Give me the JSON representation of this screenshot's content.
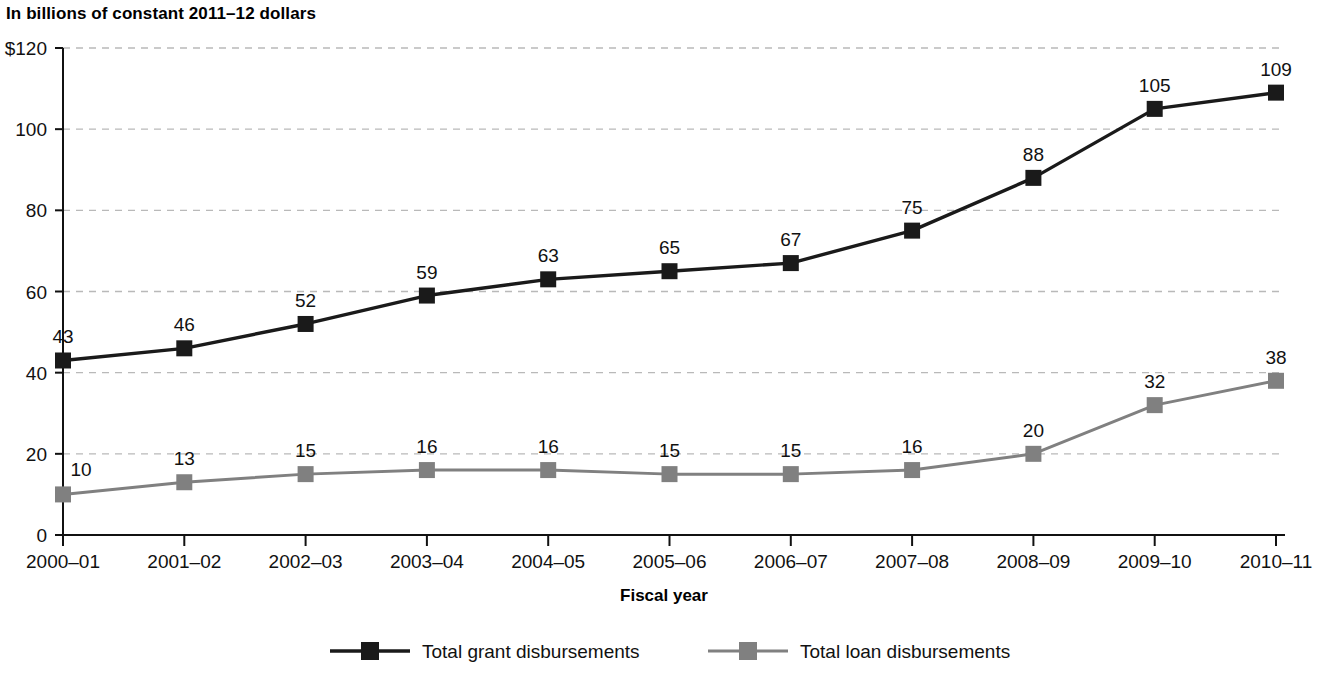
{
  "header": {
    "units_title": "In billions of constant 2011–12 dollars"
  },
  "chart_data": {
    "type": "line",
    "title": "In billions of constant 2011–12 dollars",
    "xlabel": "Fiscal year",
    "ylabel": "",
    "categories": [
      "2000–01",
      "2001–02",
      "2002–03",
      "2003–04",
      "2004–05",
      "2005–06",
      "2006–07",
      "2007–08",
      "2008–09",
      "2009–10",
      "2010–11"
    ],
    "series": [
      {
        "name": "Total grant disbursements",
        "color": "#1a1a1a",
        "marker": "square",
        "values": [
          43,
          46,
          52,
          59,
          63,
          65,
          67,
          75,
          88,
          105,
          109
        ]
      },
      {
        "name": "Total loan disbursements",
        "color": "#808080",
        "marker": "square",
        "values": [
          10,
          13,
          15,
          16,
          16,
          15,
          15,
          16,
          20,
          32,
          38
        ]
      }
    ],
    "ylim": [
      0,
      120
    ],
    "yticks": [
      0,
      20,
      40,
      60,
      80,
      100,
      120
    ],
    "ytick_labels": [
      "0",
      "20",
      "40",
      "60",
      "80",
      "100",
      "$120"
    ],
    "grid": "horizontal-dashed",
    "legend_position": "bottom"
  },
  "axis": {
    "x_title": "Fiscal year"
  },
  "legend": {
    "items": [
      {
        "label": "Total grant disbursements",
        "color": "#1a1a1a"
      },
      {
        "label": "Total loan disbursements",
        "color": "#808080"
      }
    ]
  }
}
